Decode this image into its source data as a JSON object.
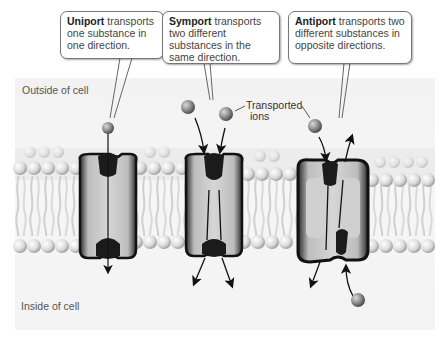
{
  "regions": {
    "outside_label": "Outside of cell",
    "inside_label": "Inside of cell"
  },
  "callouts": [
    {
      "term": "Uniport",
      "text": " transports one substance in one direction."
    },
    {
      "term": "Symport",
      "text": " transports two different substances in the same direction."
    },
    {
      "term": "Antiport",
      "text": " transports two different substances in opposite directions."
    }
  ],
  "ions_label": {
    "line1": "Transported",
    "line2": "ions"
  },
  "transporters": [
    {
      "name": "uniport",
      "ions_in": 1,
      "ions_out": 0
    },
    {
      "name": "symport",
      "ions_in": 2,
      "ions_out": 0
    },
    {
      "name": "antiport",
      "ions_in": 1,
      "ions_out": 1
    }
  ],
  "colors": {
    "background": "#f4f4f4",
    "lipid_head": "#d8d8d8",
    "protein_body": "#cfcfcf",
    "protein_edge": "#1a1a1a",
    "ion": "#8a8a8a",
    "callout_border": "#777777"
  }
}
